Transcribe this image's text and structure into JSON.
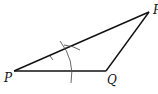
{
  "diagram": {
    "type": "triangle-construction",
    "stroke_color": "#111111",
    "arc_color": "#555555",
    "background": "#ffffff",
    "vertices": [
      {
        "id": "P",
        "label": "P",
        "x": 14,
        "y": 71,
        "label_x": 4,
        "label_y": 82
      },
      {
        "id": "Q",
        "label": "Q",
        "x": 106,
        "y": 71,
        "label_x": 107,
        "label_y": 84
      },
      {
        "id": "R",
        "label": "R",
        "x": 149,
        "y": 12,
        "label_x": 153,
        "label_y": 13
      }
    ],
    "edges": [
      {
        "from": "P",
        "to": "Q"
      },
      {
        "from": "Q",
        "to": "R"
      },
      {
        "from": "P",
        "to": "R"
      }
    ],
    "arcs": [
      {
        "description": "large construction arc centered at P crossing PR and PQ",
        "path": "M 60 41 Q 75 60 71 83"
      },
      {
        "description": "small arc mark on PR near P",
        "path": "M 64 44 Q 74 46 80 50"
      },
      {
        "description": "tick near PR",
        "path": "M 50 56 L 53 60"
      }
    ]
  }
}
